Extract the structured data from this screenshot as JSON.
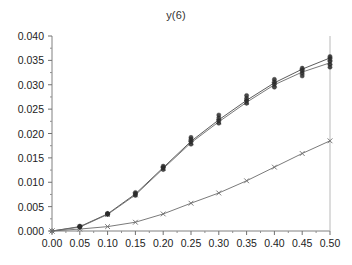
{
  "chart_data": {
    "type": "line",
    "title": "y(6)",
    "xlabel": "",
    "ylabel": "",
    "xlim": [
      0.0,
      0.5
    ],
    "ylim": [
      0.0,
      0.04
    ],
    "xticks": [
      0.0,
      0.05,
      0.1,
      0.15,
      0.2,
      0.25,
      0.3,
      0.35,
      0.4,
      0.45,
      0.5
    ],
    "xtick_labels": [
      "0.00",
      "0.05",
      "0.10",
      "0.15",
      "0.20",
      "0.25",
      "0.30",
      "0.35",
      "0.40",
      "0.45",
      "0.50"
    ],
    "yticks": [
      0.0,
      0.005,
      0.01,
      0.015,
      0.02,
      0.025,
      0.03,
      0.035,
      0.04
    ],
    "ytick_labels": [
      "0.000",
      "0.005",
      "0.010",
      "0.015",
      "0.020",
      "0.025",
      "0.030",
      "0.035",
      "0.040"
    ],
    "grid": false,
    "legend": "none",
    "minor_ticks_x": true,
    "minor_ticks_y": true,
    "x": [
      0.0,
      0.05,
      0.1,
      0.15,
      0.2,
      0.25,
      0.3,
      0.35,
      0.4,
      0.45,
      0.5
    ],
    "series": [
      {
        "name": "upper-curve-plus",
        "marker": "plus",
        "color": "#4a4a4a",
        "values": [
          0.0,
          0.0009,
          0.0035,
          0.0076,
          0.013,
          0.0184,
          0.0228,
          0.0268,
          0.0304,
          0.0332,
          0.0355
        ]
      },
      {
        "name": "upper-curve-cross",
        "marker": "cross",
        "color": "#6b6b6b",
        "values": [
          0.0,
          0.0008,
          0.0034,
          0.0074,
          0.0128,
          0.0181,
          0.0224,
          0.0264,
          0.03,
          0.0326,
          0.0345
        ]
      },
      {
        "name": "lower-curve-cross",
        "marker": "cross",
        "color": "#6b6b6b",
        "values": [
          0.0,
          0.0004,
          0.0009,
          0.0018,
          0.0035,
          0.0057,
          0.0078,
          0.0103,
          0.0131,
          0.0159,
          0.0185
        ]
      }
    ],
    "scatter_replicates": {
      "name": "replicate-points",
      "marker": "filled-circle",
      "color": "#2b2b2b",
      "points": [
        {
          "x": 0.05,
          "ys": [
            0.0008,
            0.0009,
            0.001
          ]
        },
        {
          "x": 0.1,
          "ys": [
            0.0034,
            0.0035,
            0.0036
          ]
        },
        {
          "x": 0.15,
          "ys": [
            0.0073,
            0.0076,
            0.0079
          ]
        },
        {
          "x": 0.2,
          "ys": [
            0.0126,
            0.013,
            0.0133
          ]
        },
        {
          "x": 0.25,
          "ys": [
            0.0178,
            0.0183,
            0.0188,
            0.0192
          ]
        },
        {
          "x": 0.3,
          "ys": [
            0.0221,
            0.0226,
            0.0232,
            0.0238
          ]
        },
        {
          "x": 0.35,
          "ys": [
            0.0262,
            0.0267,
            0.0272,
            0.0278
          ]
        },
        {
          "x": 0.4,
          "ys": [
            0.0295,
            0.0301,
            0.0306,
            0.0311
          ]
        },
        {
          "x": 0.45,
          "ys": [
            0.0318,
            0.0324,
            0.0329,
            0.0334
          ]
        },
        {
          "x": 0.5,
          "ys": [
            0.0336,
            0.0342,
            0.0348,
            0.0353,
            0.0358
          ]
        }
      ]
    }
  }
}
